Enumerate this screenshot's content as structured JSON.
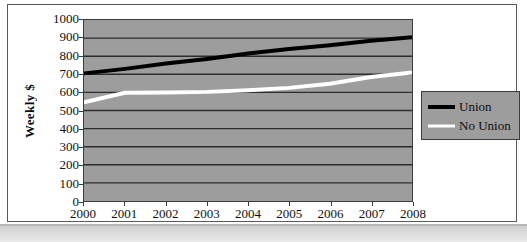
{
  "chart_data": {
    "type": "line",
    "title": "",
    "xlabel": "",
    "ylabel": "Weekly $",
    "categories": [
      "2000",
      "2001",
      "2002",
      "2003",
      "2004",
      "2005",
      "2006",
      "2007",
      "2008"
    ],
    "ylim": [
      0,
      1000
    ],
    "ytick_step": 100,
    "yticks": [
      "1000",
      "900",
      "800",
      "700",
      "600",
      "500",
      "400",
      "300",
      "200",
      "100",
      "0"
    ],
    "grid": true,
    "grid_orientation": "horizontal",
    "legend_position": "right",
    "plot_background": "#9d9d9d",
    "series": [
      {
        "name": "Union",
        "color": "#000000",
        "line_width": 4,
        "values": [
          705,
          730,
          760,
          785,
          815,
          840,
          860,
          885,
          905
        ]
      },
      {
        "name": "No Union",
        "color": "#ffffff",
        "line_width": 4,
        "values": [
          545,
          598,
          600,
          603,
          612,
          625,
          648,
          685,
          710
        ]
      }
    ]
  },
  "axes": {
    "y_title": "Weekly $",
    "y_tick_labels": [
      "1000",
      "900",
      "800",
      "700",
      "600",
      "500",
      "400",
      "300",
      "200",
      "100",
      "0"
    ],
    "x_tick_labels": [
      "2000",
      "2001",
      "2002",
      "2003",
      "2004",
      "2005",
      "2006",
      "2007",
      "2008"
    ]
  },
  "legend": {
    "entries": [
      {
        "label": "Union",
        "color": "#000000"
      },
      {
        "label": "No Union",
        "color": "#ffffff"
      }
    ]
  }
}
